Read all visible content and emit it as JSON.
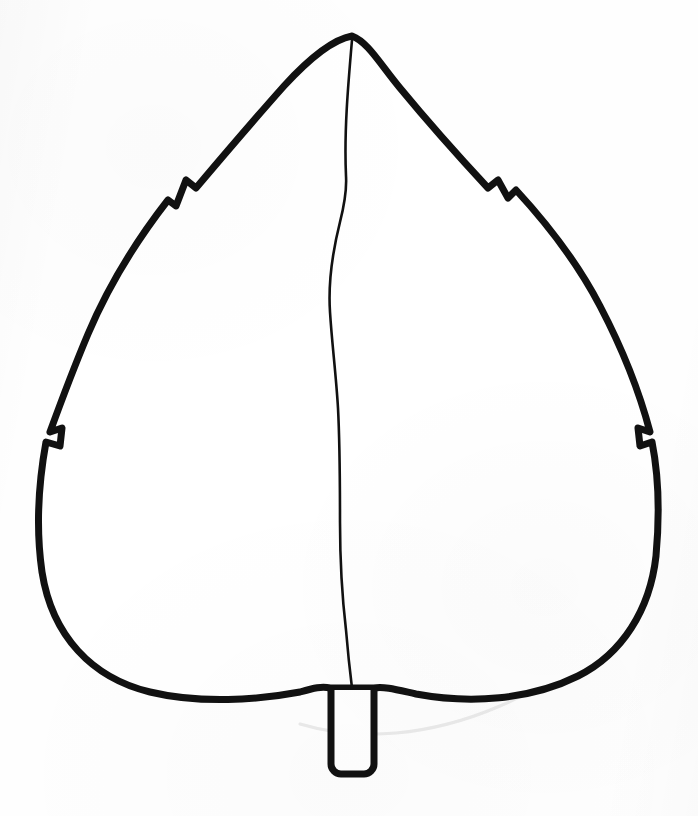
{
  "document": {
    "title": "Leaf Coloring Page",
    "kind": "line-art-coloring-page",
    "subject": "leaf",
    "caption": "",
    "background_color": "#fefefe",
    "ink_color": "#111111",
    "fill_color": "#ffffff",
    "canvas": {
      "width": 698,
      "height": 816
    }
  },
  "artwork": {
    "name": "leaf-outline-drawing",
    "description": "Hand-drawn black outline of a broad ovate leaf with a pointed apex, four small notches along the margin, a central midrib line, and a short rectangular stem at the base.",
    "stroke_width_outline": 7,
    "stroke_width_midrib": 2.6,
    "parts": [
      {
        "name": "leaf-blade-outline",
        "label": "Leaf blade outline"
      },
      {
        "name": "leaf-midrib",
        "label": "Midrib vein"
      },
      {
        "name": "leaf-stem",
        "label": "Stem / petiole"
      },
      {
        "name": "notch-upper-left",
        "label": "Upper left margin notch"
      },
      {
        "name": "notch-upper-right",
        "label": "Upper right margin notch"
      },
      {
        "name": "notch-lower-left",
        "label": "Lower left margin notch"
      },
      {
        "name": "notch-lower-right",
        "label": "Lower right margin notch"
      }
    ],
    "geometry": {
      "apex": {
        "x": 352,
        "y": 35
      },
      "leftmost": {
        "x": 40,
        "y": 432
      },
      "rightmost": {
        "x": 662,
        "y": 436
      },
      "base_center": {
        "x": 352,
        "y": 690
      },
      "stem": {
        "x": 330,
        "y": 688,
        "width": 44,
        "height": 96
      },
      "blade_path": "M352,36 C330,40 306,62 284,86 C252,122 218,162 196,188 L186,180 L176,206 L168,200 C140,236 110,282 88,334 C72,372 58,410 50,432 L62,428 L60,446 L46,442 C38,486 36,530 42,572 C52,636 92,678 150,692 C200,704 258,700 300,692 C314,688 322,686 330,688 L374,688 C384,686 398,690 416,694 C470,704 530,700 578,676 C622,654 650,610 656,556 C660,512 658,472 652,442 L640,446 L638,428 L650,432 C640,394 622,348 600,306 C574,256 540,216 516,190 L508,198 L498,180 L488,188 C462,160 428,122 400,88 C380,64 368,42 352,36 Z",
      "midrib_path": "M352,40 C348,86 344,132 346,176 C347,192 344,206 340,222 C333,250 328,282 330,312 C332,344 336,374 338,408 C340,446 340,486 340,522 C340,560 342,596 346,630 C348,654 350,672 352,688",
      "stem_path": "M331,690 L331,764 a10,10 0 0 0 10,10 L364,774 a10,10 0 0 0 10,-10 L374,690",
      "pencil_arc_path": "M300,724 C360,742 430,736 500,706 C562,680 612,636 640,588"
    }
  }
}
